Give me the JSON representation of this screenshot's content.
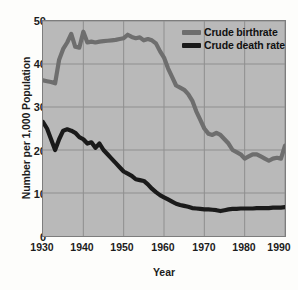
{
  "chart_data": {
    "type": "line",
    "title": "",
    "xlabel": "Year",
    "ylabel": "Number per 1,000 Population",
    "xlim": [
      1930,
      1990
    ],
    "ylim": [
      0,
      50
    ],
    "grid": true,
    "legend_position": "top-right",
    "plot_background": "#b9b9b9",
    "xticks": [
      "1930",
      "1940",
      "1950",
      "1960",
      "1970",
      "1980",
      "1990"
    ],
    "yticks": [
      "0",
      "10",
      "20",
      "30",
      "40",
      "50"
    ],
    "x": [
      1930,
      1931,
      1932,
      1933,
      1934,
      1935,
      1936,
      1937,
      1938,
      1939,
      1940,
      1941,
      1942,
      1943,
      1944,
      1945,
      1946,
      1947,
      1948,
      1949,
      1950,
      1951,
      1952,
      1953,
      1954,
      1955,
      1956,
      1957,
      1958,
      1959,
      1960,
      1961,
      1962,
      1963,
      1964,
      1965,
      1966,
      1967,
      1968,
      1969,
      1970,
      1971,
      1972,
      1973,
      1974,
      1975,
      1976,
      1977,
      1978,
      1979,
      1980,
      1981,
      1982,
      1983,
      1984,
      1985,
      1986,
      1987,
      1988,
      1989,
      1990
    ],
    "series": [
      {
        "name": "Crude birthrate",
        "color": "#6e6e6e",
        "values": [
          36.2,
          36.0,
          35.8,
          35.5,
          41.0,
          43.5,
          45.0,
          47.0,
          44.0,
          43.8,
          47.5,
          45.0,
          45.2,
          45.0,
          45.2,
          45.3,
          45.4,
          45.5,
          45.6,
          45.8,
          46.0,
          46.8,
          46.3,
          46.0,
          46.2,
          45.5,
          45.8,
          45.5,
          44.8,
          43.0,
          41.5,
          39.0,
          37.0,
          35.0,
          34.5,
          34.0,
          33.0,
          31.5,
          29.0,
          27.0,
          25.0,
          23.8,
          23.5,
          24.0,
          23.5,
          22.5,
          21.5,
          20.0,
          19.5,
          19.0,
          18.0,
          18.5,
          19.0,
          19.0,
          18.5,
          18.0,
          17.5,
          18.0,
          18.2,
          18.0,
          21.0
        ]
      },
      {
        "name": "Crude death rate",
        "color": "#1a1a1a",
        "values": [
          26.5,
          25.0,
          22.5,
          20.0,
          22.5,
          24.5,
          24.8,
          24.5,
          24.0,
          23.0,
          22.5,
          21.5,
          21.8,
          20.5,
          21.5,
          20.0,
          19.0,
          18.0,
          17.0,
          16.0,
          15.0,
          14.5,
          14.0,
          13.2,
          13.0,
          12.8,
          12.0,
          11.0,
          10.2,
          9.5,
          9.0,
          8.5,
          8.0,
          7.5,
          7.2,
          7.0,
          6.8,
          6.5,
          6.4,
          6.3,
          6.2,
          6.2,
          6.1,
          6.0,
          5.8,
          6.0,
          6.2,
          6.3,
          6.3,
          6.4,
          6.4,
          6.4,
          6.4,
          6.5,
          6.5,
          6.5,
          6.5,
          6.6,
          6.6,
          6.6,
          6.7
        ]
      }
    ]
  },
  "legend": {
    "items": [
      {
        "label": "Crude birthrate",
        "color": "#6e6e6e"
      },
      {
        "label": "Crude death rate",
        "color": "#1a1a1a"
      }
    ]
  },
  "axes": {
    "y_title": "Number per 1,000 Population",
    "x_title": "Year",
    "y_labels": [
      "50",
      "40",
      "30",
      "20",
      "10",
      "0"
    ],
    "x_labels": [
      "1930",
      "1940",
      "1950",
      "1960",
      "1970",
      "1980",
      "1990"
    ]
  }
}
